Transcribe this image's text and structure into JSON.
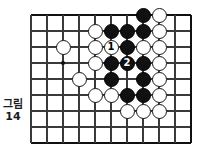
{
  "figure": {
    "caption_word": "그림",
    "caption_number": "14"
  },
  "board": {
    "grid_color": "#3a3a3a",
    "edge_color": "#111111",
    "background": "#ffffff",
    "cols": 11,
    "rows": 9,
    "origin_x": 31,
    "origin_y": 15,
    "spacing": 16,
    "star_points": [
      {
        "col": 2,
        "row": 3
      }
    ]
  },
  "stones": [
    {
      "id": "w-c5r1",
      "color": "white",
      "col": 4,
      "row": 1,
      "label": ""
    },
    {
      "id": "b-c6r1",
      "color": "black",
      "col": 5,
      "row": 1,
      "label": ""
    },
    {
      "id": "b-c7r1",
      "color": "black",
      "col": 6,
      "row": 1,
      "label": ""
    },
    {
      "id": "b-c8r1",
      "color": "black",
      "col": 7,
      "row": 1,
      "label": ""
    },
    {
      "id": "b-c8r0",
      "color": "black",
      "col": 7,
      "row": 0,
      "label": ""
    },
    {
      "id": "w-c9r0",
      "color": "white",
      "col": 8,
      "row": 0,
      "label": ""
    },
    {
      "id": "w-c9r1",
      "color": "white",
      "col": 8,
      "row": 1,
      "label": ""
    },
    {
      "id": "w-c3r2",
      "color": "white",
      "col": 2,
      "row": 2,
      "label": ""
    },
    {
      "id": "w-c5r2",
      "color": "white",
      "col": 4,
      "row": 2,
      "label": ""
    },
    {
      "id": "w-c6r2",
      "color": "white",
      "col": 5,
      "row": 2,
      "label": "1"
    },
    {
      "id": "b-c7r2",
      "color": "black",
      "col": 6,
      "row": 2,
      "label": ""
    },
    {
      "id": "w-c8r2",
      "color": "white",
      "col": 7,
      "row": 2,
      "label": ""
    },
    {
      "id": "w-c9r2",
      "color": "white",
      "col": 8,
      "row": 2,
      "label": ""
    },
    {
      "id": "w-c5r3",
      "color": "white",
      "col": 4,
      "row": 3,
      "label": ""
    },
    {
      "id": "b-c6r3",
      "color": "black",
      "col": 5,
      "row": 3,
      "label": ""
    },
    {
      "id": "b-c7r3",
      "color": "black",
      "col": 6,
      "row": 3,
      "label": "2"
    },
    {
      "id": "b-c8r3",
      "color": "black",
      "col": 7,
      "row": 3,
      "label": ""
    },
    {
      "id": "w-c9r3",
      "color": "white",
      "col": 8,
      "row": 3,
      "label": ""
    },
    {
      "id": "w-c4r4",
      "color": "white",
      "col": 3,
      "row": 4,
      "label": ""
    },
    {
      "id": "b-c6r4",
      "color": "black",
      "col": 5,
      "row": 4,
      "label": ""
    },
    {
      "id": "b-c8r4",
      "color": "black",
      "col": 7,
      "row": 4,
      "label": ""
    },
    {
      "id": "w-c9r4",
      "color": "white",
      "col": 8,
      "row": 4,
      "label": ""
    },
    {
      "id": "w-c5r5",
      "color": "white",
      "col": 4,
      "row": 5,
      "label": ""
    },
    {
      "id": "w-c6r5",
      "color": "white",
      "col": 5,
      "row": 5,
      "label": ""
    },
    {
      "id": "b-c7r5",
      "color": "black",
      "col": 6,
      "row": 5,
      "label": ""
    },
    {
      "id": "b-c8r5",
      "color": "black",
      "col": 7,
      "row": 5,
      "label": ""
    },
    {
      "id": "w-c9r5",
      "color": "white",
      "col": 8,
      "row": 5,
      "label": ""
    },
    {
      "id": "w-c7r6",
      "color": "white",
      "col": 6,
      "row": 6,
      "label": ""
    },
    {
      "id": "w-c8r6",
      "color": "white",
      "col": 7,
      "row": 6,
      "label": ""
    },
    {
      "id": "w-c9r6",
      "color": "white",
      "col": 8,
      "row": 6,
      "label": ""
    }
  ]
}
